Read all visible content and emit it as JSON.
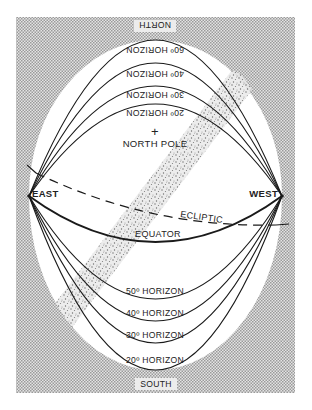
{
  "figure": {
    "compass": {
      "north": "NORTH",
      "south": "SOUTH",
      "east": "EAST",
      "west": "WEST"
    },
    "pole_label": "NORTH POLE",
    "pole_marker": "+",
    "ecliptic_label": "ECLIPTIC",
    "equator_label": "EQUATOR",
    "upper_horizons": [
      {
        "label": "60º HORIZON"
      },
      {
        "label": "40º HORIZON"
      },
      {
        "label": "30º HORIZON"
      },
      {
        "label": "20º HORIZON"
      }
    ],
    "lower_horizons": [
      {
        "label": "50º HORIZON"
      },
      {
        "label": "40º HORIZON"
      },
      {
        "label": "30º HORIZON"
      },
      {
        "label": "20º HORIZON"
      }
    ],
    "colors": {
      "line": "#1a1a1a",
      "background_texture": "#c8c8c8",
      "milky_way": "#8a8a8a"
    }
  }
}
